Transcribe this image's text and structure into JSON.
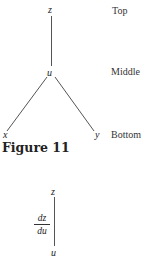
{
  "figure": {
    "caption": "Figure 11",
    "tree": {
      "nodes": {
        "top": "z",
        "middle": "u",
        "bottom_left": "x",
        "bottom_right": "y"
      },
      "levels": [
        "Top",
        "Middle",
        "Bottom"
      ]
    },
    "chain": {
      "top": "z",
      "bottom": "u",
      "derivative": {
        "numerator": "dz",
        "denominator": "du"
      }
    },
    "colors": {
      "line": "#555555",
      "text": "#222222"
    }
  }
}
